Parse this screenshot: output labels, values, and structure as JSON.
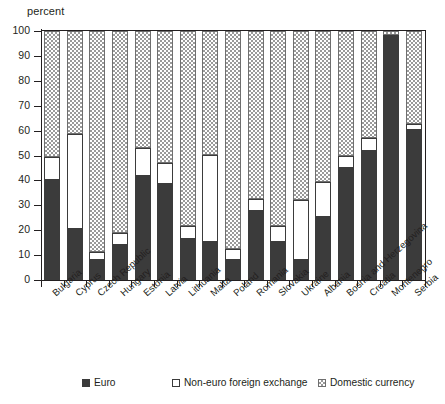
{
  "chart_data": {
    "type": "bar",
    "stacked": true,
    "title": "",
    "subtitle": "",
    "xlabel": "",
    "ylabel": "percent",
    "ylim": [
      0,
      100
    ],
    "yticks": [
      0,
      10,
      20,
      30,
      40,
      50,
      60,
      70,
      80,
      90,
      100
    ],
    "grid": false,
    "legend_position": "bottom",
    "categories": [
      "Bulgaria",
      "Cyprus",
      "Czech Republic",
      "Hungary",
      "Estonia",
      "Latvia",
      "Lithuania",
      "Malta",
      "Poland",
      "Romania",
      "Slovakia",
      "Ukraine",
      "Albania",
      "Bosnia and Herzegovina",
      "Croatia",
      "Montenegro",
      "Serbia"
    ],
    "series": [
      {
        "name": "Euro",
        "color": "#3b3b3b",
        "values": [
          40.2,
          20.6,
          8.0,
          14.0,
          41.8,
          38.7,
          16.4,
          15.3,
          8.2,
          27.7,
          15.2,
          8.0,
          25.2,
          45.1,
          51.8,
          98.6,
          60.3
        ]
      },
      {
        "name": "Non-euro foreign exchange",
        "color": "#ffffff",
        "values": [
          9.2,
          37.9,
          3.3,
          5.0,
          11.3,
          8.4,
          5.4,
          35.1,
          4.1,
          4.9,
          6.6,
          24.3,
          14.2,
          4.7,
          5.3,
          0.0,
          2.5
        ]
      },
      {
        "name": "Domestic currency",
        "color": "#9a9a9a",
        "values": [
          50.6,
          41.5,
          88.7,
          81.0,
          46.9,
          52.9,
          78.2,
          49.6,
          87.7,
          67.4,
          78.2,
          67.7,
          60.6,
          50.2,
          42.9,
          1.4,
          37.2
        ]
      }
    ]
  },
  "axis": {
    "y_title": "percent",
    "tick_labels": [
      "100",
      "90",
      "80",
      "70",
      "60",
      "50",
      "40",
      "30",
      "20",
      "10",
      "0"
    ]
  },
  "legend": {
    "items": [
      {
        "label": "Euro",
        "swatch": "euro-swatch-icon"
      },
      {
        "label": "Non-euro foreign exchange",
        "swatch": "non-euro-swatch-icon"
      },
      {
        "label": "Domestic currency",
        "swatch": "domestic-swatch-icon"
      }
    ]
  }
}
